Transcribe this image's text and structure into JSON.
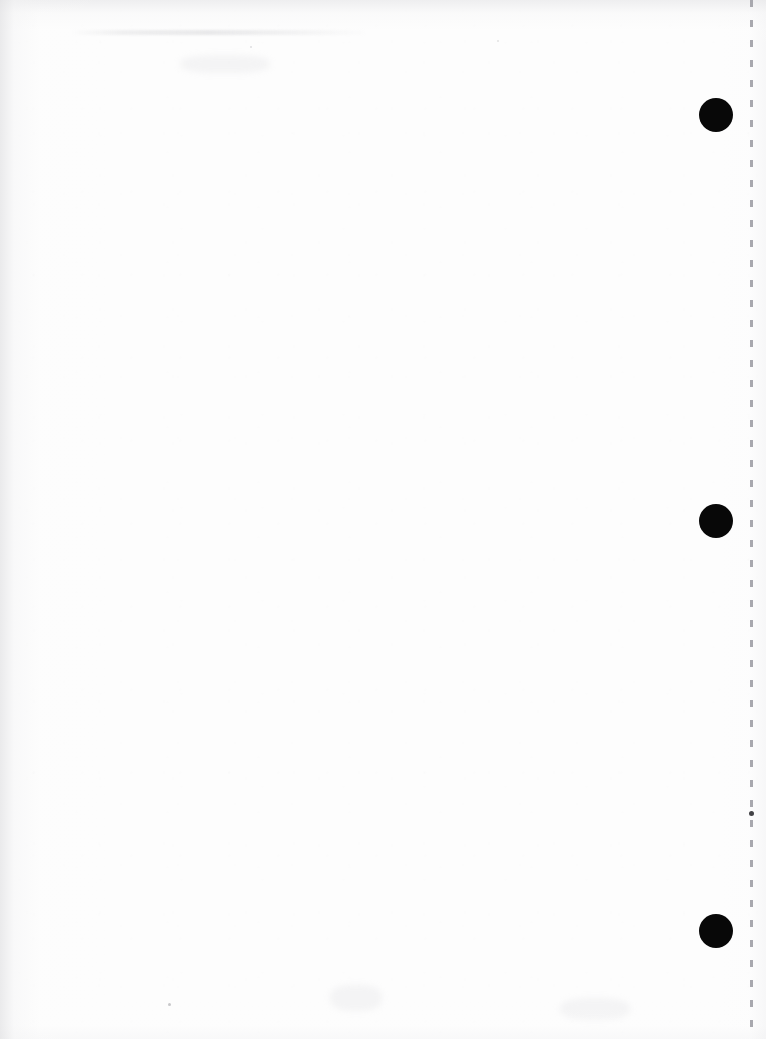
{
  "document": {
    "type": "scanned-page",
    "page_state": "blank",
    "visible_text": "",
    "width_px": 766,
    "height_px": 1039,
    "paper_color": "#fdfdfd",
    "ink_color": "#080808",
    "edge_shadow_color": "#e2e2e4",
    "description": "Blank scanned sheet with three solid black registration marks down the right margin and a faint vertical perforation line at the right edge"
  },
  "registration_marks": [
    {
      "id": "mark-top",
      "label": "",
      "cx": 716,
      "cy": 115,
      "diameter": 34,
      "color": "#080808"
    },
    {
      "id": "mark-middle",
      "label": "",
      "cx": 716,
      "cy": 521,
      "diameter": 34,
      "color": "#080808"
    },
    {
      "id": "mark-bottom",
      "label": "",
      "cx": 716,
      "cy": 931,
      "diameter": 34,
      "color": "#080808"
    }
  ],
  "perforation": {
    "label": "",
    "x": 750,
    "dash_length": 7,
    "dash_gap": 13,
    "color": "#a8a8ae",
    "dot": {
      "x": 750,
      "y": 813,
      "size": 5,
      "color": "#424246"
    }
  },
  "artifacts": {
    "top_smudge": {
      "x": 70,
      "y": 30,
      "width": 300,
      "height": 5
    },
    "specks": [
      {
        "x": 168,
        "y": 1003,
        "size": 3
      },
      {
        "x": 250,
        "y": 46,
        "size": 2
      },
      {
        "x": 497,
        "y": 40,
        "size": 2
      }
    ],
    "ghost_blotches": [
      {
        "x": 330,
        "y": 985,
        "width": 52,
        "height": 26
      },
      {
        "x": 560,
        "y": 998,
        "width": 70,
        "height": 22
      },
      {
        "x": 180,
        "y": 55,
        "width": 90,
        "height": 18
      }
    ]
  }
}
